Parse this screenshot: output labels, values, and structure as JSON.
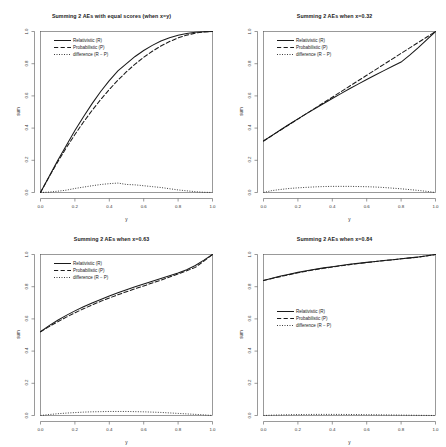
{
  "figure": {
    "panel_count": 4,
    "layout": "2x2",
    "background": "#ffffff"
  },
  "chart_data": [
    {
      "type": "line",
      "title": "Summing 2 AEs with equal scores (when x=y)",
      "xlabel": "y",
      "ylabel": "sum",
      "xlim": [
        0.0,
        1.0
      ],
      "ylim": [
        0.0,
        1.0
      ],
      "grid": false,
      "legend_position": "top-left",
      "xticks": [
        "0.0",
        "0.2",
        "0.4",
        "0.6",
        "0.8",
        "1.0"
      ],
      "yticks": [
        "0.0",
        "0.2",
        "0.4",
        "0.6",
        "0.8",
        "1.0"
      ],
      "x": [
        0.0,
        0.05,
        0.1,
        0.15,
        0.2,
        0.25,
        0.3,
        0.35,
        0.4,
        0.45,
        0.5,
        0.55,
        0.6,
        0.65,
        0.7,
        0.75,
        0.8,
        0.85,
        0.9,
        0.95,
        1.0
      ],
      "series": [
        {
          "name": "Relativistic (R)",
          "style": "solid",
          "values": [
            0.0,
            0.1,
            0.198,
            0.292,
            0.385,
            0.471,
            0.552,
            0.627,
            0.695,
            0.756,
            0.8,
            0.845,
            0.882,
            0.914,
            0.941,
            0.961,
            0.976,
            0.988,
            0.995,
            0.999,
            1.0
          ]
        },
        {
          "name": "Probabilistic (P)",
          "style": "dashed",
          "values": [
            0.0,
            0.0975,
            0.19,
            0.2775,
            0.36,
            0.4375,
            0.51,
            0.5775,
            0.64,
            0.6975,
            0.75,
            0.7975,
            0.84,
            0.8775,
            0.91,
            0.9375,
            0.96,
            0.9775,
            0.99,
            0.9975,
            1.0
          ]
        },
        {
          "name": "difference (R − P)",
          "style": "dotted",
          "values": [
            0.0,
            0.0025,
            0.008,
            0.0145,
            0.025,
            0.0335,
            0.042,
            0.0495,
            0.055,
            0.0585,
            0.05,
            0.0475,
            0.042,
            0.0365,
            0.031,
            0.0235,
            0.016,
            0.0105,
            0.005,
            0.0015,
            0.0
          ]
        }
      ]
    },
    {
      "type": "line",
      "title": "Summing 2 AEs when x=0.32",
      "xlabel": "y",
      "ylabel": "sum",
      "xlim": [
        0.0,
        1.0
      ],
      "ylim": [
        0.0,
        1.0
      ],
      "grid": false,
      "legend_position": "top-left",
      "xticks": [
        "0.0",
        "0.2",
        "0.4",
        "0.6",
        "0.8",
        "1.0"
      ],
      "yticks": [
        "0.0",
        "0.2",
        "0.4",
        "0.6",
        "0.8",
        "1.0"
      ],
      "x": [
        0.0,
        0.05,
        0.1,
        0.15,
        0.2,
        0.25,
        0.3,
        0.35,
        0.4,
        0.45,
        0.5,
        0.55,
        0.6,
        0.65,
        0.7,
        0.75,
        0.8,
        0.85,
        0.9,
        0.95,
        1.0
      ],
      "series": [
        {
          "name": "Relativistic (R)",
          "style": "solid",
          "values": [
            0.32,
            0.355,
            0.39,
            0.424,
            0.457,
            0.49,
            0.522,
            0.553,
            0.584,
            0.614,
            0.644,
            0.673,
            0.702,
            0.73,
            0.757,
            0.784,
            0.81,
            0.853,
            0.9,
            0.95,
            1.0
          ]
        },
        {
          "name": "Probabilistic (P)",
          "style": "dashed",
          "values": [
            0.32,
            0.354,
            0.388,
            0.422,
            0.456,
            0.49,
            0.524,
            0.558,
            0.592,
            0.626,
            0.66,
            0.694,
            0.728,
            0.762,
            0.796,
            0.83,
            0.864,
            0.898,
            0.932,
            0.966,
            1.0
          ]
        },
        {
          "name": "difference (R − P)",
          "style": "dotted",
          "values": [
            0.0,
            0.012,
            0.019,
            0.025,
            0.029,
            0.032,
            0.035,
            0.037,
            0.038,
            0.038,
            0.038,
            0.037,
            0.036,
            0.034,
            0.031,
            0.027,
            0.023,
            0.018,
            0.013,
            0.007,
            0.0
          ]
        }
      ]
    },
    {
      "type": "line",
      "title": "Summing 2 AEs when x=0.63",
      "xlabel": "y",
      "ylabel": "sum",
      "xlim": [
        0.0,
        1.0
      ],
      "ylim": [
        0.0,
        1.0
      ],
      "grid": false,
      "legend_position": "top-left",
      "xticks": [
        "0.0",
        "0.2",
        "0.4",
        "0.6",
        "0.8",
        "1.0"
      ],
      "yticks": [
        "0.0",
        "0.2",
        "0.4",
        "0.6",
        "0.8",
        "1.0"
      ],
      "x": [
        0.0,
        0.05,
        0.1,
        0.15,
        0.2,
        0.25,
        0.3,
        0.35,
        0.4,
        0.45,
        0.5,
        0.55,
        0.6,
        0.65,
        0.7,
        0.75,
        0.8,
        0.85,
        0.9,
        0.95,
        1.0
      ],
      "series": [
        {
          "name": "Relativistic (R)",
          "style": "solid",
          "values": [
            0.52,
            0.558,
            0.592,
            0.622,
            0.65,
            0.675,
            0.699,
            0.721,
            0.742,
            0.762,
            0.781,
            0.799,
            0.817,
            0.834,
            0.851,
            0.868,
            0.885,
            0.905,
            0.932,
            0.965,
            1.0
          ]
        },
        {
          "name": "Probabilistic (P)",
          "style": "dashed",
          "values": [
            0.52,
            0.552,
            0.582,
            0.611,
            0.638,
            0.663,
            0.687,
            0.709,
            0.73,
            0.75,
            0.769,
            0.787,
            0.805,
            0.823,
            0.841,
            0.86,
            0.879,
            0.899,
            0.92,
            0.959,
            1.0
          ]
        },
        {
          "name": "difference (R − P)",
          "style": "dotted",
          "values": [
            0.0,
            0.006,
            0.011,
            0.015,
            0.018,
            0.021,
            0.023,
            0.024,
            0.025,
            0.025,
            0.025,
            0.024,
            0.023,
            0.021,
            0.019,
            0.016,
            0.013,
            0.01,
            0.007,
            0.004,
            0.0
          ]
        }
      ]
    },
    {
      "type": "line",
      "title": "Summing 2 AEs when x=0.84",
      "xlabel": "y",
      "ylabel": "sum",
      "xlim": [
        0.0,
        1.0
      ],
      "ylim": [
        0.0,
        1.0
      ],
      "grid": false,
      "legend_position": "middle-left",
      "xticks": [
        "0.0",
        "0.2",
        "0.4",
        "0.6",
        "0.8",
        "1.0"
      ],
      "yticks": [
        "0.0",
        "0.2",
        "0.4",
        "0.6",
        "0.8",
        "1.0"
      ],
      "x": [
        0.0,
        0.05,
        0.1,
        0.15,
        0.2,
        0.25,
        0.3,
        0.35,
        0.4,
        0.45,
        0.5,
        0.55,
        0.6,
        0.65,
        0.7,
        0.75,
        0.8,
        0.85,
        0.9,
        0.95,
        1.0
      ],
      "series": [
        {
          "name": "Relativistic (R)",
          "style": "solid",
          "values": [
            0.838,
            0.853,
            0.866,
            0.878,
            0.889,
            0.899,
            0.908,
            0.917,
            0.924,
            0.932,
            0.939,
            0.945,
            0.951,
            0.957,
            0.963,
            0.968,
            0.974,
            0.979,
            0.985,
            0.992,
            1.0
          ]
        },
        {
          "name": "Probabilistic (P)",
          "style": "dashed",
          "values": [
            0.838,
            0.851,
            0.863,
            0.875,
            0.886,
            0.896,
            0.906,
            0.914,
            0.922,
            0.93,
            0.937,
            0.944,
            0.95,
            0.956,
            0.962,
            0.967,
            0.973,
            0.978,
            0.984,
            0.991,
            1.0
          ]
        },
        {
          "name": "difference (R − P)",
          "style": "dotted",
          "values": [
            0.0,
            0.0022,
            0.0038,
            0.005,
            0.0058,
            0.0063,
            0.0067,
            0.0068,
            0.0068,
            0.0066,
            0.0063,
            0.0058,
            0.0053,
            0.0047,
            0.004,
            0.0033,
            0.0026,
            0.0019,
            0.0012,
            0.0006,
            0.0
          ]
        }
      ]
    }
  ]
}
